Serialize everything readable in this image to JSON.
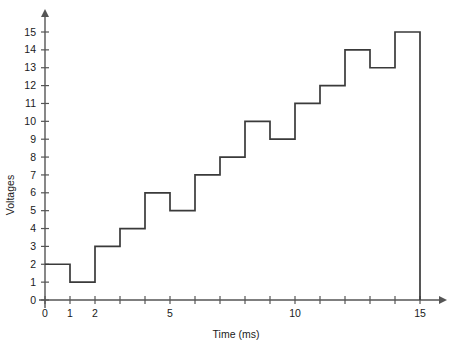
{
  "chart_data": {
    "type": "line",
    "subtype": "step",
    "title": "",
    "xlabel": "Time (ms)",
    "ylabel": "Voltages",
    "xlim": [
      0,
      15
    ],
    "ylim": [
      0,
      15
    ],
    "grid": false,
    "legend": false,
    "x_tick_values": [
      0,
      1,
      2,
      3,
      4,
      5,
      6,
      7,
      8,
      9,
      10,
      11,
      12,
      13,
      14,
      15
    ],
    "x_tick_labels": [
      "0",
      "1",
      "2",
      "",
      "",
      "5",
      "",
      "",
      "",
      "",
      "10",
      "",
      "",
      "",
      "",
      "15"
    ],
    "y_tick_values": [
      0,
      1,
      2,
      3,
      4,
      5,
      6,
      7,
      8,
      9,
      10,
      11,
      12,
      13,
      14,
      15
    ],
    "y_tick_labels": [
      "0",
      "1",
      "2",
      "3",
      "4",
      "5",
      "6",
      "7",
      "8",
      "9",
      "10",
      "11",
      "12",
      "13",
      "14",
      "15"
    ],
    "categories": [
      "0-1",
      "1-2",
      "2-3",
      "3-4",
      "4-5",
      "5-6",
      "6-7",
      "7-8",
      "8-9",
      "9-10",
      "10-11",
      "11-12",
      "12-13",
      "13-14",
      "14-15"
    ],
    "x": [
      0,
      1,
      2,
      3,
      4,
      5,
      6,
      7,
      8,
      9,
      10,
      11,
      12,
      13,
      14,
      15
    ],
    "values": [
      2,
      1,
      3,
      4,
      6,
      5,
      7,
      8,
      10,
      9,
      11,
      12,
      14,
      13,
      15
    ],
    "series": [
      {
        "name": "Voltage",
        "values": [
          2,
          1,
          3,
          4,
          6,
          5,
          7,
          8,
          10,
          9,
          11,
          12,
          14,
          13,
          15
        ]
      }
    ],
    "line_color": "#3a3a3a",
    "axis_color": "#555555",
    "background_color": "#ffffff",
    "axis_arrows": true
  }
}
